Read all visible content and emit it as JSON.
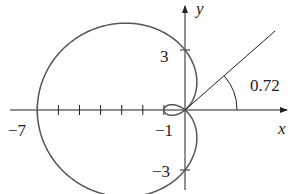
{
  "diagram": {
    "type": "polar-curve",
    "curve": "r = 3 - 4cos(theta)",
    "colors": {
      "curve": "#555555",
      "axis": "#222222",
      "text": "#222222"
    },
    "axes": {
      "x_label": "x",
      "y_label": "y"
    },
    "tick_labels": {
      "x_neg7": "−7",
      "x_neg1": "−1",
      "y_3": "3",
      "y_neg3": "−3"
    },
    "angle_label": "0.72",
    "angle_value": 0.72,
    "origin_px": [
      185,
      110
    ],
    "scale_x": 21.1,
    "scale_y": 20.0
  }
}
